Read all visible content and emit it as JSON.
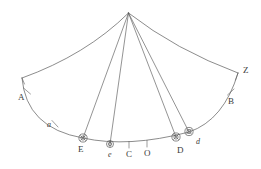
{
  "figure": {
    "type": "geometric-diagram",
    "background_color": "#ffffff",
    "stroke_color": "#5a5a5a",
    "label_color": "#3a3a3a",
    "apex": {
      "x": 128.5,
      "y": 13
    },
    "labels": [
      {
        "id": "A",
        "text": "A",
        "x": 18,
        "y": 97,
        "style": "upper"
      },
      {
        "id": "a",
        "text": "a",
        "x": 47,
        "y": 126,
        "style": "lower"
      },
      {
        "id": "E",
        "text": "E",
        "x": 78,
        "y": 149,
        "style": "upper"
      },
      {
        "id": "e",
        "text": "e",
        "x": 108,
        "y": 154,
        "style": "lower"
      },
      {
        "id": "C",
        "text": "C",
        "x": 126,
        "y": 150,
        "style": "upper"
      },
      {
        "id": "O",
        "text": "O",
        "x": 144,
        "y": 150,
        "style": "upper"
      },
      {
        "id": "D",
        "text": "D",
        "x": 177,
        "y": 148,
        "style": "upper"
      },
      {
        "id": "d",
        "text": "d",
        "x": 196,
        "y": 141,
        "style": "lower"
      },
      {
        "id": "B",
        "text": "B",
        "x": 228,
        "y": 100,
        "style": "upper"
      },
      {
        "id": "Z",
        "text": "Z",
        "x": 243,
        "y": 70,
        "style": "upper"
      }
    ],
    "circled_markers": [
      {
        "id": "marker-E",
        "x": 83,
        "y": 138,
        "radius": 4,
        "glyph": "circled-x"
      },
      {
        "id": "marker-e",
        "x": 110,
        "y": 144,
        "radius": 3.4,
        "glyph": "circled-dot"
      },
      {
        "id": "marker-D",
        "x": 176,
        "y": 137,
        "radius": 4,
        "glyph": "circled-x"
      },
      {
        "id": "marker-d",
        "x": 189,
        "y": 132,
        "radius": 4,
        "glyph": "circled-x"
      }
    ],
    "tick_marks": [
      {
        "id": "tick-A",
        "x": 27,
        "y": 91
      },
      {
        "id": "tick-a",
        "x": 55,
        "y": 124
      },
      {
        "id": "tick-C",
        "x": 129,
        "y": 145
      },
      {
        "id": "tick-O",
        "x": 147,
        "y": 144
      },
      {
        "id": "tick-B",
        "x": 231,
        "y": 92
      }
    ],
    "rays": [
      {
        "id": "ray-apex-to-E",
        "to_x": 83,
        "to_y": 138
      },
      {
        "id": "ray-apex-to-e",
        "to_x": 110,
        "to_y": 144
      },
      {
        "id": "ray-apex-to-D",
        "to_x": 176,
        "to_y": 137
      },
      {
        "id": "ray-apex-to-d",
        "to_x": 189,
        "to_y": 132
      }
    ],
    "arcs": {
      "upper_left": "M 128.5 13 Q 86 55 22 78",
      "upper_right": "M 128.5 13 Q 176 50 238 73",
      "lower_horizon": "M 22 78 Q 26 128 83 138 Q 128 148 189 132 Q 224 120 238 73",
      "left_base_tip": "M 22 78 L 24 84",
      "right_base_tip": "M 238 73 L 236 80"
    }
  }
}
